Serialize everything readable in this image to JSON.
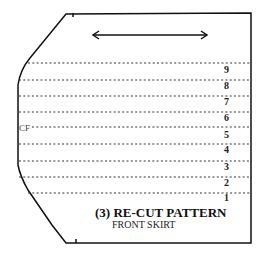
{
  "diagram": {
    "title": "(3) RE-CUT PATTERN",
    "subtitle": "FRONT SKIRT",
    "center_front_label": "CF",
    "grainline": "double-headed-arrow",
    "line_labels": [
      "9",
      "8",
      "7",
      "6",
      "5",
      "4",
      "3",
      "2",
      "1"
    ],
    "colors": {
      "outline": "#111111",
      "dotted": "#333333",
      "background": "#ffffff"
    }
  }
}
